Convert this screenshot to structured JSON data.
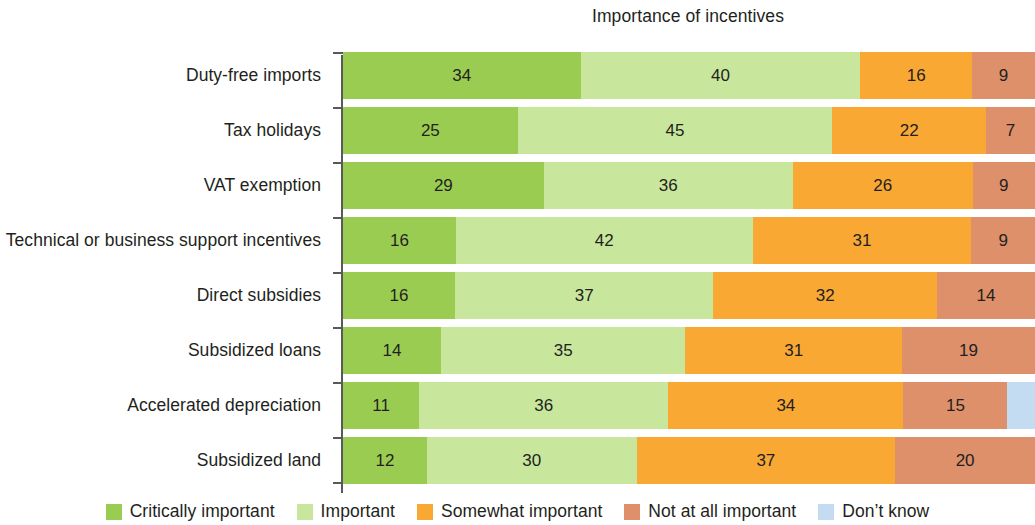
{
  "chart_data": {
    "type": "bar",
    "subtype": "horizontal-100-percent-stacked",
    "title": "Importance of incentives",
    "xlabel": "",
    "ylabel": "",
    "xlim": [
      0,
      100
    ],
    "grid": false,
    "legend_position": "bottom",
    "categories": [
      "Duty-free imports",
      "Tax holidays",
      "VAT exemption",
      "Technical or business support incentives",
      "Direct subsidies",
      "Subsidized loans",
      "Accelerated depreciation",
      "Subsidized land"
    ],
    "series": [
      {
        "name": "Critically important",
        "color": "#9BCC52",
        "values": [
          34,
          25,
          29,
          16,
          16,
          14,
          11,
          12
        ]
      },
      {
        "name": "Important",
        "color": "#C8E79D",
        "values": [
          40,
          45,
          36,
          42,
          37,
          35,
          36,
          30
        ]
      },
      {
        "name": "Somewhat important",
        "color": "#F9A834",
        "values": [
          16,
          22,
          26,
          31,
          32,
          31,
          34,
          37
        ]
      },
      {
        "name": "Not at all important",
        "color": "#DD9069",
        "values": [
          9,
          7,
          9,
          9,
          14,
          19,
          15,
          20
        ]
      },
      {
        "name": "Don't know",
        "color": "#C3DCF2",
        "values": [
          0,
          0,
          0,
          0,
          0,
          0,
          4,
          0
        ]
      }
    ],
    "data_labels": [
      [
        "34",
        "40",
        "16",
        "9",
        ""
      ],
      [
        "25",
        "45",
        "22",
        "7",
        ""
      ],
      [
        "29",
        "36",
        "26",
        "9",
        ""
      ],
      [
        "16",
        "42",
        "31",
        "9",
        ""
      ],
      [
        "16",
        "37",
        "32",
        "14",
        ""
      ],
      [
        "14",
        "35",
        "31",
        "19",
        ""
      ],
      [
        "11",
        "36",
        "34",
        "15",
        ""
      ],
      [
        "12",
        "30",
        "37",
        "20",
        ""
      ]
    ]
  },
  "legend": {
    "items": [
      {
        "label": "Critically important",
        "color": "#9BCC52"
      },
      {
        "label": "Important",
        "color": "#C8E79D"
      },
      {
        "label": "Somewhat important",
        "color": "#F9A834"
      },
      {
        "label": "Not at all important",
        "color": "#DD9069"
      },
      {
        "label": "Don’t know",
        "color": "#C3DCF2"
      }
    ]
  }
}
